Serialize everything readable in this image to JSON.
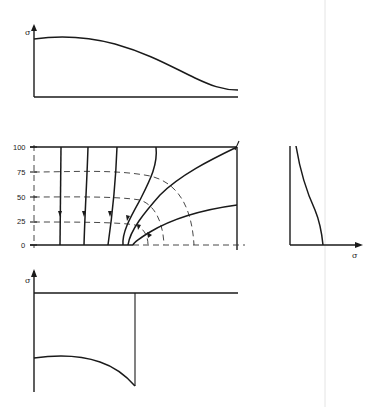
{
  "figure": {
    "top_plot": {
      "y_axis_label": "σ",
      "description": "Stress distribution along top edge: roughly flat then decreasing smoothly"
    },
    "main_plot": {
      "y_ticks": [
        "100",
        "75",
        "50",
        "25",
        "0"
      ],
      "description": "Stress trajectories (solid with arrows) and dashed circular contours around a notch/crack tip at the bottom edge"
    },
    "right_plot": {
      "x_axis_label": "σ",
      "description": "Stress distribution along right edge"
    },
    "bottom_plot": {
      "y_axis_label": "σ",
      "description": "Stress distribution along bottom edge: negative region ending at crack tip"
    }
  }
}
